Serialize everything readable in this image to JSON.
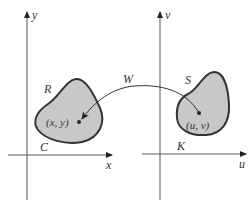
{
  "diagram": {
    "left_plane": {
      "x_axis_label": "x",
      "y_axis_label": "y",
      "region_label": "R",
      "boundary_label": "C",
      "point_label": "(x, y)"
    },
    "right_plane": {
      "x_axis_label": "u",
      "y_axis_label": "v",
      "region_label": "S",
      "boundary_label": "K",
      "point_label": "(u, v)"
    },
    "mapping_label": "W",
    "colors": {
      "region_fill": "#c8c8c8",
      "stroke": "#333333",
      "background": "#ffffff"
    }
  }
}
